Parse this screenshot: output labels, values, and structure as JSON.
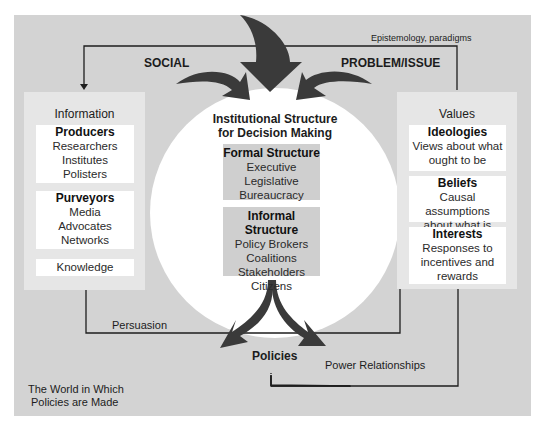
{
  "labels": {
    "social": "SOCIAL",
    "problem_issue": "PROBLEM/ISSUE",
    "epistemology": "Epistemology, paradigms",
    "persuasion": "Persuasion",
    "policies": "Policies",
    "power_relationships": "Power Relationships",
    "world_line1": "The World in Which",
    "world_line2": "Policies are Made"
  },
  "information_panel": {
    "title": "Information",
    "producers": {
      "heading": "Producers",
      "items": [
        "Researchers",
        "Institutes",
        "Polisters"
      ]
    },
    "purveyors": {
      "heading": "Purveyors",
      "items": [
        "Media",
        "Advocates",
        "Networks"
      ]
    },
    "knowledge": "Knowledge"
  },
  "institutional": {
    "title_line1": "Institutional Structure",
    "title_line2": "for Decision Making",
    "formal": {
      "heading": "Formal Structure",
      "items": [
        "Executive",
        "Legislative",
        "Bureaucracy"
      ]
    },
    "informal": {
      "heading": "Informal Structure",
      "items": [
        "Policy Brokers",
        "Coalitions",
        "Stakeholders",
        "Citizens"
      ]
    }
  },
  "values_panel": {
    "title": "Values",
    "ideologies": {
      "heading": "Ideologies",
      "lines": [
        "Views about what",
        "ought to be"
      ]
    },
    "beliefs": {
      "heading": "Beliefs",
      "lines": [
        "Causal assumptions",
        "about what is"
      ]
    },
    "interests": {
      "heading": "Interests",
      "lines": [
        "Responses to",
        "incentives and",
        "rewards"
      ]
    }
  },
  "colors": {
    "frame": "#d3d3d3",
    "panel": "#e6e6e6",
    "inner_box": "#cfcfcf",
    "arrow": "#3a3a3a",
    "line": "#1e1e1e"
  }
}
